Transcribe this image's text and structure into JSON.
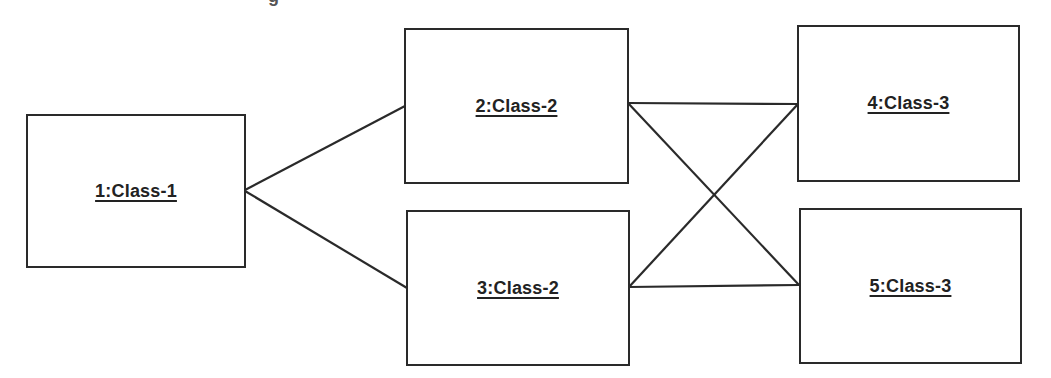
{
  "diagram": {
    "type": "object-interaction-graph",
    "top_cutoff_text": "g",
    "nodes": [
      {
        "id": "1",
        "label": "1:Class-1",
        "x": 26,
        "y": 114,
        "w": 220,
        "h": 154
      },
      {
        "id": "2",
        "label": "2:Class-2",
        "x": 404,
        "y": 28,
        "w": 225,
        "h": 156
      },
      {
        "id": "3",
        "label": "3:Class-2",
        "x": 406,
        "y": 210,
        "w": 224,
        "h": 156
      },
      {
        "id": "4",
        "label": "4:Class-3",
        "x": 797,
        "y": 25,
        "w": 223,
        "h": 157
      },
      {
        "id": "5",
        "label": "5:Class-3",
        "x": 799,
        "y": 208,
        "w": 223,
        "h": 156
      }
    ],
    "edges": [
      {
        "from": "1",
        "to": "2",
        "x1": 245,
        "y1": 190,
        "x2": 405,
        "y2": 106
      },
      {
        "from": "1",
        "to": "3",
        "x1": 245,
        "y1": 191,
        "x2": 407,
        "y2": 288
      },
      {
        "from": "2",
        "to": "4",
        "x1": 628,
        "y1": 103,
        "x2": 798,
        "y2": 104
      },
      {
        "from": "2",
        "to": "5",
        "x1": 628,
        "y1": 103,
        "x2": 799,
        "y2": 285
      },
      {
        "from": "3",
        "to": "4",
        "x1": 629,
        "y1": 287,
        "x2": 798,
        "y2": 104
      },
      {
        "from": "3",
        "to": "5",
        "x1": 629,
        "y1": 287,
        "x2": 799,
        "y2": 285
      }
    ],
    "colors": {
      "stroke": "#2a2a2a",
      "text": "#222222",
      "background": "#ffffff"
    }
  }
}
